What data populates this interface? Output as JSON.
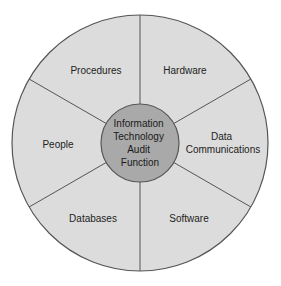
{
  "diagram": {
    "center": {
      "lines": [
        "Information",
        "Technology",
        "Audit",
        "Function"
      ]
    },
    "sectors": [
      {
        "id": "procedures",
        "lines": [
          "Procedures"
        ]
      },
      {
        "id": "hardware",
        "lines": [
          "Hardware"
        ]
      },
      {
        "id": "data-communications",
        "lines": [
          "Data",
          "Communications"
        ]
      },
      {
        "id": "software",
        "lines": [
          "Software"
        ]
      },
      {
        "id": "databases",
        "lines": [
          "Databases"
        ]
      },
      {
        "id": "people",
        "lines": [
          "People"
        ]
      }
    ],
    "colors": {
      "background": "#ffffff",
      "sector_fill": "#dcdcdc",
      "center_fill": "#a9a9a9",
      "stroke": "#555555",
      "text": "#222222"
    }
  }
}
